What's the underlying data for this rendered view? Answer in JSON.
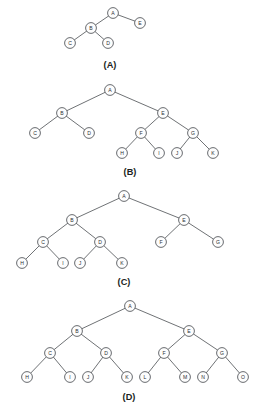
{
  "figure": {
    "background_color": "#ffffff",
    "node_fill_color": "#fdfdfd",
    "node_stroke_color": "#4d5055",
    "edge_color": "#55585c",
    "label_color": "#2c2e31",
    "caption_color": "#1d1f22",
    "node_radius": 5.4
  },
  "diagrams": [
    {
      "id": "tree-a",
      "caption": "(A)",
      "caption_x": 110,
      "caption_y": 65,
      "nodes": [
        {
          "label": "A",
          "x": 113,
          "y": 13
        },
        {
          "label": "E",
          "x": 140,
          "y": 23
        },
        {
          "label": "B",
          "x": 91,
          "y": 28
        },
        {
          "label": "C",
          "x": 70,
          "y": 43
        },
        {
          "label": "D",
          "x": 108,
          "y": 43
        }
      ],
      "edges": [
        {
          "from": "A",
          "to": "B"
        },
        {
          "from": "A",
          "to": "E"
        },
        {
          "from": "B",
          "to": "C"
        },
        {
          "from": "B",
          "to": "D"
        }
      ]
    },
    {
      "id": "tree-b",
      "caption": "(B)",
      "caption_x": 130,
      "caption_y": 172,
      "nodes": [
        {
          "label": "A",
          "x": 110,
          "y": 90
        },
        {
          "label": "B",
          "x": 62,
          "y": 113
        },
        {
          "label": "E",
          "x": 163,
          "y": 113
        },
        {
          "label": "C",
          "x": 35,
          "y": 133
        },
        {
          "label": "D",
          "x": 89,
          "y": 133
        },
        {
          "label": "F",
          "x": 141,
          "y": 133
        },
        {
          "label": "G",
          "x": 193,
          "y": 133
        },
        {
          "label": "H",
          "x": 122,
          "y": 153
        },
        {
          "label": "I",
          "x": 159,
          "y": 153
        },
        {
          "label": "J",
          "x": 177,
          "y": 153
        },
        {
          "label": "K",
          "x": 213,
          "y": 153
        }
      ],
      "edges": [
        {
          "from": "A",
          "to": "B"
        },
        {
          "from": "A",
          "to": "E"
        },
        {
          "from": "B",
          "to": "C"
        },
        {
          "from": "B",
          "to": "D"
        },
        {
          "from": "E",
          "to": "F"
        },
        {
          "from": "E",
          "to": "G"
        },
        {
          "from": "F",
          "to": "H"
        },
        {
          "from": "F",
          "to": "I"
        },
        {
          "from": "G",
          "to": "J"
        },
        {
          "from": "G",
          "to": "K"
        }
      ]
    },
    {
      "id": "tree-c",
      "caption": "(C)",
      "caption_x": 124,
      "caption_y": 282,
      "nodes": [
        {
          "label": "A",
          "x": 124,
          "y": 196
        },
        {
          "label": "B",
          "x": 72,
          "y": 220
        },
        {
          "label": "E",
          "x": 184,
          "y": 220
        },
        {
          "label": "C",
          "x": 43,
          "y": 242
        },
        {
          "label": "D",
          "x": 100,
          "y": 242
        },
        {
          "label": "F",
          "x": 161,
          "y": 242
        },
        {
          "label": "G",
          "x": 218,
          "y": 242
        },
        {
          "label": "H",
          "x": 22,
          "y": 263
        },
        {
          "label": "I",
          "x": 63,
          "y": 263
        },
        {
          "label": "J",
          "x": 80,
          "y": 263
        },
        {
          "label": "K",
          "x": 122,
          "y": 263
        }
      ],
      "edges": [
        {
          "from": "A",
          "to": "B"
        },
        {
          "from": "A",
          "to": "E"
        },
        {
          "from": "B",
          "to": "C"
        },
        {
          "from": "B",
          "to": "D"
        },
        {
          "from": "C",
          "to": "H"
        },
        {
          "from": "C",
          "to": "I"
        },
        {
          "from": "D",
          "to": "J"
        },
        {
          "from": "D",
          "to": "K"
        },
        {
          "from": "E",
          "to": "F"
        },
        {
          "from": "E",
          "to": "G"
        }
      ]
    },
    {
      "id": "tree-d",
      "caption": "(D)",
      "caption_x": 129,
      "caption_y": 397,
      "nodes": [
        {
          "label": "A",
          "x": 130,
          "y": 306
        },
        {
          "label": "B",
          "x": 77,
          "y": 331
        },
        {
          "label": "E",
          "x": 189,
          "y": 331
        },
        {
          "label": "C",
          "x": 50,
          "y": 353
        },
        {
          "label": "D",
          "x": 106,
          "y": 353
        },
        {
          "label": "F",
          "x": 164,
          "y": 353
        },
        {
          "label": "G",
          "x": 222,
          "y": 353
        },
        {
          "label": "H",
          "x": 27,
          "y": 377
        },
        {
          "label": "I",
          "x": 70,
          "y": 377
        },
        {
          "label": "J",
          "x": 88,
          "y": 377
        },
        {
          "label": "K",
          "x": 127,
          "y": 377
        },
        {
          "label": "L",
          "x": 145,
          "y": 377
        },
        {
          "label": "M",
          "x": 185,
          "y": 377
        },
        {
          "label": "N",
          "x": 203,
          "y": 377
        },
        {
          "label": "O",
          "x": 243,
          "y": 377
        }
      ],
      "edges": [
        {
          "from": "A",
          "to": "B"
        },
        {
          "from": "A",
          "to": "E"
        },
        {
          "from": "B",
          "to": "C"
        },
        {
          "from": "B",
          "to": "D"
        },
        {
          "from": "C",
          "to": "H"
        },
        {
          "from": "C",
          "to": "I"
        },
        {
          "from": "D",
          "to": "J"
        },
        {
          "from": "D",
          "to": "K"
        },
        {
          "from": "E",
          "to": "F"
        },
        {
          "from": "E",
          "to": "G"
        },
        {
          "from": "F",
          "to": "L"
        },
        {
          "from": "F",
          "to": "M"
        },
        {
          "from": "G",
          "to": "N"
        },
        {
          "from": "G",
          "to": "O"
        }
      ]
    }
  ]
}
